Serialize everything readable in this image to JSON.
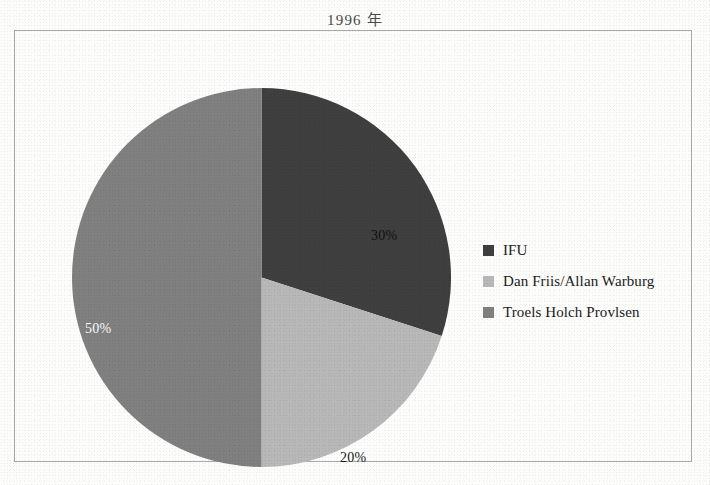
{
  "chart_data": {
    "type": "pie",
    "title": "1996 年",
    "categories": [
      "IFU",
      "Dan Friis/Allan Warburg",
      "Troels Holch Provlsen"
    ],
    "values": [
      30,
      20,
      50
    ],
    "labels": [
      "30%",
      "20%",
      "50%"
    ],
    "colors": [
      "#3f3f3f",
      "#b8b8b8",
      "#808080"
    ],
    "start_angle_deg": 0,
    "direction": "clockwise",
    "legend_position": "right",
    "grid": false,
    "xlabel": "",
    "ylabel": ""
  },
  "frame": {
    "border_color": "#a9a9a9",
    "background": "#fdfdfb"
  }
}
